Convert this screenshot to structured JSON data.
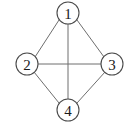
{
  "figure": {
    "background_color": "#ffffff",
    "edge_color": "#6e6e6e",
    "node_stroke_color": "#4a4a4a",
    "node_fill_color": "#ffffff",
    "label_color": "#1a1a1a"
  },
  "chart_data": {
    "type": "diagram",
    "graph_type": "undirected-complete-graph",
    "title": "",
    "nodes": [
      {
        "id": "1",
        "label": "1",
        "cx": 68,
        "cy": 13,
        "r": 11,
        "position": "top"
      },
      {
        "id": "2",
        "label": "2",
        "cx": 27,
        "cy": 64,
        "r": 11,
        "position": "left"
      },
      {
        "id": "3",
        "label": "3",
        "cx": 112,
        "cy": 64,
        "r": 11,
        "position": "right"
      },
      {
        "id": "4",
        "label": "4",
        "cx": 68,
        "cy": 110,
        "r": 11,
        "position": "bottom"
      }
    ],
    "edges": [
      {
        "from": "1",
        "to": "2",
        "x1": 59,
        "y1": 20,
        "x2": 35,
        "y2": 57
      },
      {
        "from": "1",
        "to": "3",
        "x1": 77,
        "y1": 20,
        "x2": 104,
        "y2": 57
      },
      {
        "from": "1",
        "to": "4",
        "x1": 68,
        "y1": 24,
        "x2": 68,
        "y2": 99
      },
      {
        "from": "2",
        "to": "3",
        "x1": 38,
        "y1": 64,
        "x2": 101,
        "y2": 64
      },
      {
        "from": "2",
        "to": "4",
        "x1": 34,
        "y1": 72,
        "x2": 59,
        "y2": 103
      },
      {
        "from": "3",
        "to": "4",
        "x1": 105,
        "y1": 72,
        "x2": 77,
        "y2": 103
      }
    ],
    "edge_count": 6,
    "node_count": 4
  }
}
